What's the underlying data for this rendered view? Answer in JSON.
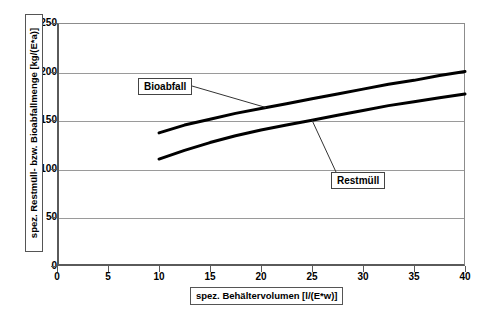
{
  "chart_data": {
    "type": "line",
    "title": "",
    "xlabel": "spez. Behältervolumen [l/(E*w)]",
    "ylabel": "spez. Restmüll- bzw. Bioabfallmenge [kg/(E*a)]",
    "xlim": [
      0,
      40
    ],
    "ylim": [
      0,
      250
    ],
    "xticks": [
      0,
      5,
      10,
      15,
      20,
      25,
      30,
      35,
      40
    ],
    "yticks": [
      0,
      50,
      100,
      150,
      200,
      250
    ],
    "xtick_labels": [
      "0",
      "5",
      "10",
      "15",
      "20",
      "25",
      "30",
      "35",
      "40"
    ],
    "ytick_labels": [
      "0",
      "50",
      "100",
      "150",
      "200",
      "250"
    ],
    "grid": "horizontal",
    "legend": "inline-callouts",
    "x": [
      10,
      12.5,
      15,
      17.5,
      20,
      22.5,
      25,
      27.5,
      30,
      32.5,
      35,
      37.5,
      40
    ],
    "series": [
      {
        "name": "Bioabfall",
        "values": [
          137,
          145,
          151,
          157,
          162,
          167,
          172,
          177,
          182,
          187,
          191,
          196,
          200
        ]
      },
      {
        "name": "Restmüll",
        "values": [
          110,
          119,
          127,
          134,
          140,
          145,
          150,
          155,
          160,
          165,
          169,
          173,
          177
        ]
      }
    ],
    "annotations": [
      {
        "label": "Bioabfall",
        "points_to_x": 20.5,
        "points_to_y": 163
      },
      {
        "label": "Restmüll",
        "points_to_x": 25.0,
        "points_to_y": 150
      }
    ]
  },
  "axes": {
    "y_title": "spez. Restmüll- bzw. Bioabfallmenge [kg/(E*a)]",
    "x_title": "spez. Behältervolumen [l/(E*w)]",
    "y_labels": [
      "250",
      "200",
      "150",
      "100",
      "50",
      "0"
    ],
    "x_labels": [
      "0",
      "5",
      "10",
      "15",
      "20",
      "25",
      "30",
      "35",
      "40"
    ]
  },
  "callouts": {
    "bioabfall": "Bioabfall",
    "restmuell": "Restmüll"
  },
  "colors": {
    "curve": "#000000",
    "grid": "#9a9a9a",
    "axis": "#5a5a5a",
    "background": "#ffffff"
  }
}
